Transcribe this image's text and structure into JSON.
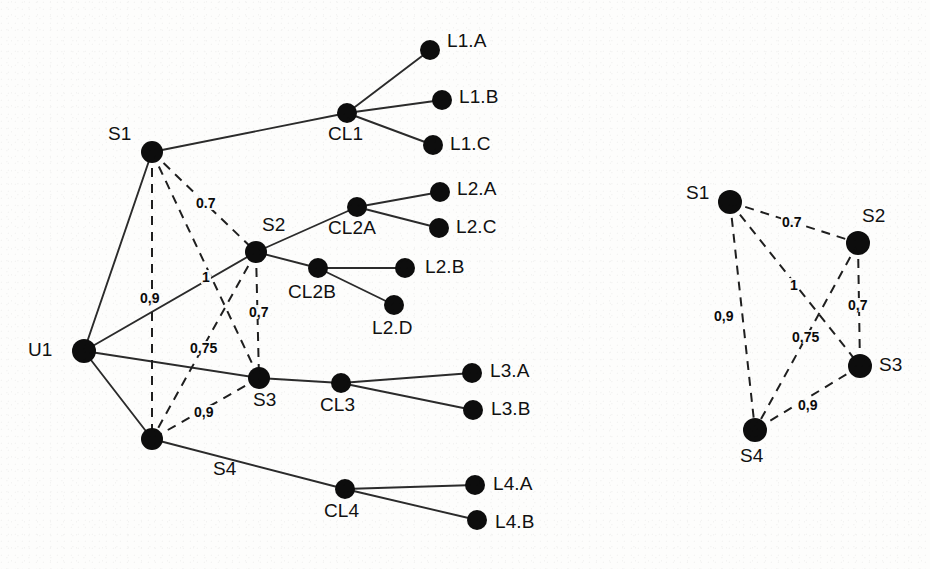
{
  "figure": {
    "background_color": "#fdfdfc",
    "node_color": "#0d0d0d",
    "solid_edge_color": "#2b2b2b",
    "dashed_edge_color": "#1f1f1f"
  },
  "left_graph": {
    "name": "topology-graph",
    "nodes": [
      {
        "id": "U1",
        "label": "U1",
        "x": 84,
        "y": 351,
        "r": 12,
        "label_x": 28,
        "label_y": 340
      },
      {
        "id": "S1",
        "label": "S1",
        "x": 152,
        "y": 152,
        "r": 11,
        "label_x": 108,
        "label_y": 124
      },
      {
        "id": "S2",
        "label": "S2",
        "x": 256,
        "y": 252,
        "r": 11,
        "label_x": 262,
        "label_y": 215
      },
      {
        "id": "S3",
        "label": "S3",
        "x": 259,
        "y": 378,
        "r": 11,
        "label_x": 253,
        "label_y": 390
      },
      {
        "id": "S4",
        "label": "S4",
        "x": 152,
        "y": 439,
        "r": 11,
        "label_x": 213,
        "label_y": 459
      },
      {
        "id": "CL1",
        "label": "CL1",
        "x": 347,
        "y": 113,
        "r": 10,
        "label_x": 328,
        "label_y": 124
      },
      {
        "id": "CL2A",
        "label": "CL2A",
        "x": 357,
        "y": 207,
        "r": 10,
        "label_x": 328,
        "label_y": 218
      },
      {
        "id": "CL2B",
        "label": "CL2B",
        "x": 318,
        "y": 268,
        "r": 10,
        "label_x": 288,
        "label_y": 282
      },
      {
        "id": "CL3",
        "label": "CL3",
        "x": 341,
        "y": 383,
        "r": 10,
        "label_x": 320,
        "label_y": 395
      },
      {
        "id": "CL4",
        "label": "CL4",
        "x": 345,
        "y": 489,
        "r": 10,
        "label_x": 324,
        "label_y": 501
      },
      {
        "id": "L1.A",
        "label": "L1.A",
        "x": 430,
        "y": 50,
        "r": 10,
        "label_x": 447,
        "label_y": 31
      },
      {
        "id": "L1.B",
        "label": "L1.B",
        "x": 442,
        "y": 100,
        "r": 10,
        "label_x": 459,
        "label_y": 87
      },
      {
        "id": "L1.C",
        "label": "L1.C",
        "x": 433,
        "y": 145,
        "r": 10,
        "label_x": 450,
        "label_y": 134
      },
      {
        "id": "L2.A",
        "label": "L2.A",
        "x": 440,
        "y": 192,
        "r": 10,
        "label_x": 457,
        "label_y": 179
      },
      {
        "id": "L2.C",
        "label": "L2.C",
        "x": 439,
        "y": 228,
        "r": 10,
        "label_x": 456,
        "label_y": 217
      },
      {
        "id": "L2.B",
        "label": "L2.B",
        "x": 405,
        "y": 268,
        "r": 10,
        "label_x": 425,
        "label_y": 257
      },
      {
        "id": "L2.D",
        "label": "L2.D",
        "x": 394,
        "y": 305,
        "r": 10,
        "label_x": 372,
        "label_y": 318
      },
      {
        "id": "L3.A",
        "label": "L3.A",
        "x": 472,
        "y": 373,
        "r": 10,
        "label_x": 490,
        "label_y": 361
      },
      {
        "id": "L3.B",
        "label": "L3.B",
        "x": 473,
        "y": 410,
        "r": 10,
        "label_x": 491,
        "label_y": 399
      },
      {
        "id": "L4.A",
        "label": "L4.A",
        "x": 475,
        "y": 485,
        "r": 10,
        "label_x": 493,
        "label_y": 474
      },
      {
        "id": "L4.B",
        "label": "L4.B",
        "x": 477,
        "y": 520,
        "r": 10,
        "label_x": 495,
        "label_y": 512
      }
    ],
    "solid_edges": [
      {
        "from": "U1",
        "to": "S1"
      },
      {
        "from": "U1",
        "to": "S2"
      },
      {
        "from": "U1",
        "to": "S3"
      },
      {
        "from": "U1",
        "to": "S4"
      },
      {
        "from": "S1",
        "to": "CL1"
      },
      {
        "from": "S2",
        "to": "CL2A"
      },
      {
        "from": "S2",
        "to": "CL2B"
      },
      {
        "from": "S3",
        "to": "CL3"
      },
      {
        "from": "S4",
        "to": "CL4"
      },
      {
        "from": "CL1",
        "to": "L1.A"
      },
      {
        "from": "CL1",
        "to": "L1.B"
      },
      {
        "from": "CL1",
        "to": "L1.C"
      },
      {
        "from": "CL2A",
        "to": "L2.A"
      },
      {
        "from": "CL2A",
        "to": "L2.C"
      },
      {
        "from": "CL2B",
        "to": "L2.B"
      },
      {
        "from": "CL2B",
        "to": "L2.D"
      },
      {
        "from": "CL3",
        "to": "L3.A"
      },
      {
        "from": "CL3",
        "to": "L3.B"
      },
      {
        "from": "CL4",
        "to": "L4.A"
      },
      {
        "from": "CL4",
        "to": "L4.B"
      }
    ],
    "dashed_edges": [
      {
        "from": "S1",
        "to": "S2",
        "weight": "0.7",
        "label_x": 195,
        "label_y": 196
      },
      {
        "from": "S1",
        "to": "S3",
        "weight": "1",
        "label_x": 201,
        "label_y": 270
      },
      {
        "from": "S1",
        "to": "S4",
        "weight": "0,9",
        "label_x": 139,
        "label_y": 291
      },
      {
        "from": "S2",
        "to": "S3",
        "weight": "0,7",
        "label_x": 248,
        "label_y": 305
      },
      {
        "from": "S2",
        "to": "S4",
        "weight": "0,75",
        "label_x": 189,
        "label_y": 341
      },
      {
        "from": "S3",
        "to": "S4",
        "weight": "0,9",
        "label_x": 193,
        "label_y": 405
      }
    ]
  },
  "right_graph": {
    "name": "similarity-graph",
    "nodes": [
      {
        "id": "S1",
        "label": "S1",
        "x": 730,
        "y": 202,
        "r": 12,
        "label_x": 686,
        "label_y": 183
      },
      {
        "id": "S2",
        "label": "S2",
        "x": 858,
        "y": 243,
        "r": 12,
        "label_x": 862,
        "label_y": 206
      },
      {
        "id": "S3",
        "label": "S3",
        "x": 860,
        "y": 366,
        "r": 12,
        "label_x": 879,
        "label_y": 355
      },
      {
        "id": "S4",
        "label": "S4",
        "x": 755,
        "y": 430,
        "r": 12,
        "label_x": 740,
        "label_y": 446
      }
    ],
    "dashed_edges": [
      {
        "from": "S1",
        "to": "S2",
        "weight": "0.7",
        "label_x": 781,
        "label_y": 215
      },
      {
        "from": "S1",
        "to": "S3",
        "weight": "1",
        "label_x": 789,
        "label_y": 278
      },
      {
        "from": "S1",
        "to": "S4",
        "weight": "0,9",
        "label_x": 713,
        "label_y": 309
      },
      {
        "from": "S2",
        "to": "S3",
        "weight": "0,7",
        "label_x": 847,
        "label_y": 298
      },
      {
        "from": "S2",
        "to": "S4",
        "weight": "0,75",
        "label_x": 791,
        "label_y": 330
      },
      {
        "from": "S3",
        "to": "S4",
        "weight": "0,9",
        "label_x": 797,
        "label_y": 398
      }
    ]
  }
}
